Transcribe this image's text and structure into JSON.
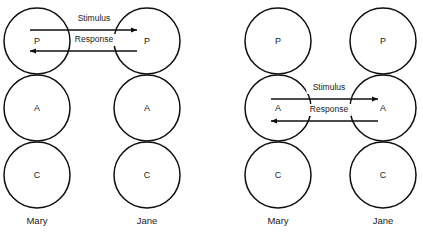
{
  "figure": {
    "background_color": "#ffffff",
    "line_color": "#0f0f0f",
    "text_color": "#1a1a1a"
  },
  "ego_states": [
    {
      "key": "P",
      "letter": "P",
      "name": "Parent"
    },
    {
      "key": "A",
      "letter": "A",
      "name": "Adult"
    },
    {
      "key": "C",
      "letter": "C",
      "name": "Child"
    }
  ],
  "diagrams": [
    {
      "id": "parent-to-parent",
      "transaction_level": "P",
      "people": [
        {
          "role": "sender",
          "label": "Mary",
          "cx": 37,
          "letters": [
            "P",
            "A",
            "C"
          ]
        },
        {
          "role": "receiver",
          "label": "Jane",
          "cx": 147,
          "letters": [
            "P",
            "A",
            "C"
          ]
        }
      ],
      "arrows": [
        {
          "label": "Stimulus",
          "direction": "right",
          "x1": 30,
          "x2": 137,
          "y": 30,
          "label_x": 94,
          "label_y": 19
        },
        {
          "label": "Response",
          "direction": "left",
          "x1": 137,
          "x2": 30,
          "y": 51,
          "label_x": 94,
          "label_y": 40
        }
      ]
    },
    {
      "id": "adult-to-adult",
      "transaction_level": "A",
      "people": [
        {
          "role": "sender",
          "label": "Mary",
          "cx": 278,
          "letters": [
            "P",
            "A",
            "C"
          ]
        },
        {
          "role": "receiver",
          "label": "Jane",
          "cx": 383,
          "letters": [
            "P",
            "A",
            "C"
          ]
        }
      ],
      "arrows": [
        {
          "label": "Stimulus",
          "direction": "right",
          "x1": 271,
          "x2": 378,
          "y": 99,
          "label_x": 329,
          "label_y": 88
        },
        {
          "label": "Response",
          "direction": "left",
          "x1": 378,
          "x2": 271,
          "y": 121,
          "label_x": 329,
          "label_y": 110
        }
      ]
    }
  ],
  "geometry": {
    "circle_radius": 33,
    "row_centers": {
      "P": 41,
      "A": 108,
      "C": 175
    },
    "person_label_y": 221
  }
}
